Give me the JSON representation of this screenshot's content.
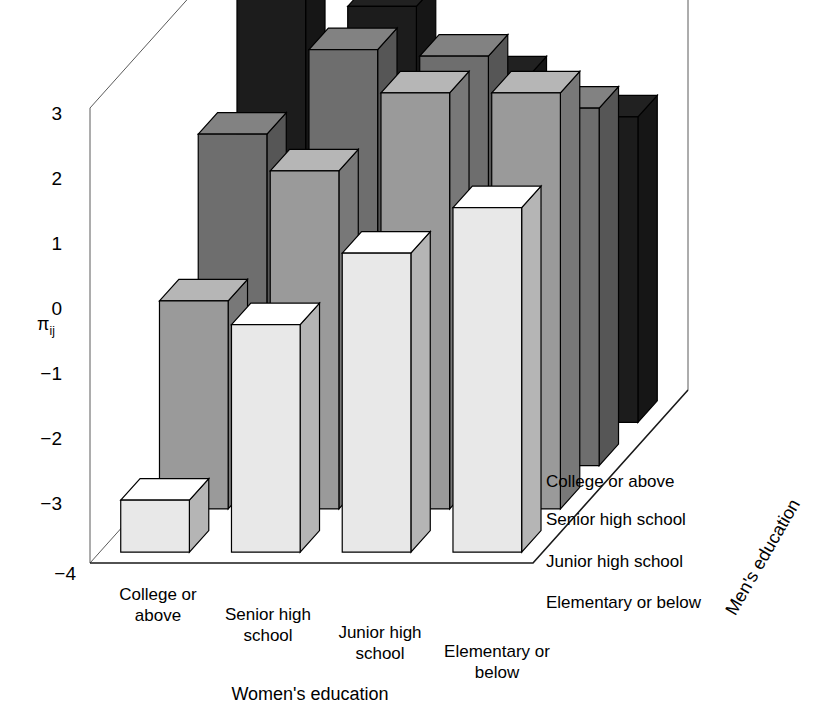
{
  "figure": {
    "type": "3d-bar-chart",
    "background_color": "#ffffff",
    "vertical_axis_title": "π",
    "vertical_axis_subscript": "ij",
    "x_axis_title": "Women's education",
    "z_axis_title": "Men's education"
  },
  "axes": {
    "y_ticks": [
      "3",
      "2",
      "1",
      "0",
      "-1",
      "-2",
      "-3",
      "-4"
    ],
    "x_categories": [
      "College or above",
      "Senior high school",
      "Junior high school",
      "Elementary or below"
    ],
    "x_categories_lines": [
      [
        "College or",
        "above"
      ],
      [
        "Senior high",
        "school"
      ],
      [
        "Junior high",
        "school"
      ],
      [
        "Elementary or",
        "below"
      ]
    ],
    "z_categories": [
      "Elementary or below",
      "Junior high school",
      "Senior high school",
      "College or above"
    ]
  },
  "chart_data": {
    "type": "bar",
    "title": "",
    "xlabel": "Women's education",
    "ylabel": "πij",
    "zlabel": "Men's education",
    "ylim": [
      -4,
      3
    ],
    "grid": false,
    "legend": "none",
    "categories": [
      "College or above",
      "Senior high school",
      "Junior high school",
      "Elementary or below"
    ],
    "series": [
      {
        "name": "Elementary or below",
        "color": "#e8e8e8",
        "values": [
          -3.2,
          -0.5,
          0.6,
          1.3
        ]
      },
      {
        "name": "Junior high school",
        "color": "#9a9a9a",
        "values": [
          -0.8,
          1.2,
          2.4,
          2.4
        ]
      },
      {
        "name": "Senior high school",
        "color": "#6e6e6e",
        "values": [
          1.1,
          2.4,
          2.3,
          1.5
        ]
      },
      {
        "name": "College or above",
        "color": "#1c1c1c",
        "values": [
          2.7,
          2.4,
          1.3,
          0.7
        ]
      }
    ]
  },
  "geometry": {
    "origin_x": 90,
    "origin_y": 563,
    "x_span": 443,
    "y_top": 113,
    "y_bottom": 568,
    "depth_dx": 155,
    "depth_dy": -173,
    "bar_width_frac": 0.62,
    "bar_depth_frac": 0.5
  },
  "shading": {
    "top_lighten": 1.18,
    "side_darken": 0.78
  }
}
